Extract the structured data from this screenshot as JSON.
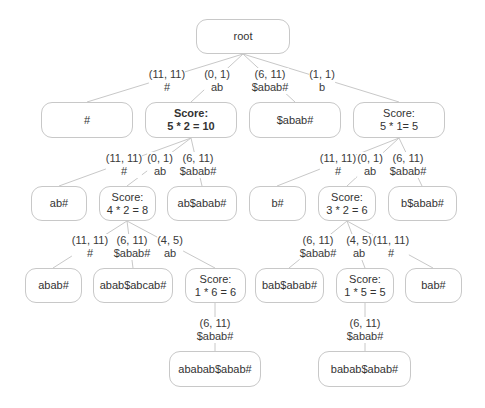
{
  "diagram": {
    "type": "suffix-tree-score",
    "nodes": [
      {
        "id": "root",
        "lines": [
          "root"
        ],
        "x": 196,
        "y": 19,
        "w": 94,
        "h": 35,
        "bold": false
      },
      {
        "id": "n_hash",
        "lines": [
          "#"
        ],
        "x": 41,
        "y": 102,
        "w": 92,
        "h": 36,
        "bold": false
      },
      {
        "id": "n_ab",
        "lines": [
          "Score:",
          "5 * 2 = 10"
        ],
        "x": 145,
        "y": 102,
        "w": 92,
        "h": 36,
        "bold": true
      },
      {
        "id": "n_sabab",
        "lines": [
          "$abab#"
        ],
        "x": 249,
        "y": 102,
        "w": 92,
        "h": 36,
        "bold": false
      },
      {
        "id": "n_b",
        "lines": [
          "Score:",
          "5 * 1= 5"
        ],
        "x": 353,
        "y": 102,
        "w": 92,
        "h": 36,
        "bold": false
      },
      {
        "id": "n_abhash",
        "lines": [
          "ab#"
        ],
        "x": 31,
        "y": 186,
        "w": 56,
        "h": 35,
        "bold": false
      },
      {
        "id": "n_abab",
        "lines": [
          "Score:",
          "4 * 2 = 8"
        ],
        "x": 99,
        "y": 186,
        "w": 57,
        "h": 35,
        "bold": false
      },
      {
        "id": "n_absabab",
        "lines": [
          "ab$abab#"
        ],
        "x": 167,
        "y": 186,
        "w": 70,
        "h": 35,
        "bold": false
      },
      {
        "id": "n_bhash",
        "lines": [
          "b#"
        ],
        "x": 249,
        "y": 186,
        "w": 57,
        "h": 35,
        "bold": false
      },
      {
        "id": "n_bab",
        "lines": [
          "Score:",
          "3 * 2 = 6"
        ],
        "x": 318,
        "y": 186,
        "w": 58,
        "h": 35,
        "bold": false
      },
      {
        "id": "n_bsabab",
        "lines": [
          "b$abab#"
        ],
        "x": 388,
        "y": 186,
        "w": 69,
        "h": 35,
        "bold": false
      },
      {
        "id": "n_ababhash",
        "lines": [
          "abab#"
        ],
        "x": 25,
        "y": 268,
        "w": 57,
        "h": 35,
        "bold": false
      },
      {
        "id": "n_ababsabcab",
        "lines": [
          "abab$abcab#"
        ],
        "x": 93,
        "y": 268,
        "w": 80,
        "h": 35,
        "bold": false
      },
      {
        "id": "n_ababab",
        "lines": [
          "Score:",
          "1 * 6 = 6"
        ],
        "x": 185,
        "y": 268,
        "w": 61,
        "h": 35,
        "bold": false
      },
      {
        "id": "n_babsabab",
        "lines": [
          "bab$abab#"
        ],
        "x": 255,
        "y": 268,
        "w": 69,
        "h": 35,
        "bold": false
      },
      {
        "id": "n_babab",
        "lines": [
          "Score:",
          "1 * 5 = 5"
        ],
        "x": 336,
        "y": 268,
        "w": 58,
        "h": 35,
        "bold": false
      },
      {
        "id": "n_babhash",
        "lines": [
          "bab#"
        ],
        "x": 405,
        "y": 268,
        "w": 57,
        "h": 35,
        "bold": false
      },
      {
        "id": "n_abababsabab",
        "lines": [
          "ababab$abab#"
        ],
        "x": 169,
        "y": 351,
        "w": 92,
        "h": 36,
        "bold": false
      },
      {
        "id": "n_bababsabab",
        "lines": [
          "babab$abab#"
        ],
        "x": 318,
        "y": 351,
        "w": 93,
        "h": 36,
        "bold": false
      }
    ],
    "edges": [
      {
        "from": "root",
        "to": "n_hash",
        "range": "(11, 11)",
        "substr": "#",
        "lx": 167,
        "ly": 68,
        "x1": 243,
        "y1": 54,
        "x2": 87,
        "y2": 102
      },
      {
        "from": "root",
        "to": "n_ab",
        "range": "(0, 1)",
        "substr": "ab",
        "lx": 217,
        "ly": 68,
        "x1": 243,
        "y1": 54,
        "x2": 191,
        "y2": 102
      },
      {
        "from": "root",
        "to": "n_sabab",
        "range": "(6, 11)",
        "substr": "$abab#",
        "lx": 270,
        "ly": 68,
        "x1": 243,
        "y1": 54,
        "x2": 295,
        "y2": 102
      },
      {
        "from": "root",
        "to": "n_b",
        "range": "(1, 1)",
        "substr": "b",
        "lx": 322,
        "ly": 68,
        "x1": 243,
        "y1": 54,
        "x2": 399,
        "y2": 102
      },
      {
        "from": "n_ab",
        "to": "n_abhash",
        "range": "(11, 11)",
        "substr": "#",
        "lx": 124,
        "ly": 152,
        "x1": 191,
        "y1": 138,
        "x2": 59,
        "y2": 186
      },
      {
        "from": "n_ab",
        "to": "n_abab",
        "range": "(0, 1)",
        "substr": "ab",
        "lx": 160,
        "ly": 152,
        "x1": 191,
        "y1": 138,
        "x2": 127,
        "y2": 186
      },
      {
        "from": "n_ab",
        "to": "n_absabab",
        "range": "(6, 11)",
        "substr": "$abab#",
        "lx": 198,
        "ly": 152,
        "x1": 191,
        "y1": 138,
        "x2": 202,
        "y2": 186
      },
      {
        "from": "n_b",
        "to": "n_bhash",
        "range": "(11, 11)",
        "substr": "#",
        "lx": 338,
        "ly": 152,
        "x1": 399,
        "y1": 138,
        "x2": 277,
        "y2": 186
      },
      {
        "from": "n_b",
        "to": "n_bab",
        "range": "(0, 1)",
        "substr": "ab",
        "lx": 370,
        "ly": 152,
        "x1": 399,
        "y1": 138,
        "x2": 347,
        "y2": 186
      },
      {
        "from": "n_b",
        "to": "n_bsabab",
        "range": "(6, 11)",
        "substr": "$abab#",
        "lx": 408,
        "ly": 152,
        "x1": 399,
        "y1": 138,
        "x2": 422,
        "y2": 186
      },
      {
        "from": "n_abab",
        "to": "n_ababhash",
        "range": "(11, 11)",
        "substr": "#",
        "lx": 90,
        "ly": 234,
        "x1": 127,
        "y1": 221,
        "x2": 53,
        "y2": 268
      },
      {
        "from": "n_abab",
        "to": "n_ababsabcab",
        "range": "(6, 11)",
        "substr": "$abab#",
        "lx": 132,
        "ly": 234,
        "x1": 127,
        "y1": 221,
        "x2": 133,
        "y2": 268
      },
      {
        "from": "n_abab",
        "to": "n_ababab",
        "range": "(4, 5)",
        "substr": "ab",
        "lx": 170,
        "ly": 234,
        "x1": 127,
        "y1": 221,
        "x2": 215,
        "y2": 268
      },
      {
        "from": "n_bab",
        "to": "n_babsabab",
        "range": "(6, 11)",
        "substr": "$abab#",
        "lx": 318,
        "ly": 234,
        "x1": 347,
        "y1": 221,
        "x2": 289,
        "y2": 268
      },
      {
        "from": "n_bab",
        "to": "n_babab",
        "range": "(4, 5)",
        "substr": "ab",
        "lx": 359,
        "ly": 234,
        "x1": 347,
        "y1": 221,
        "x2": 365,
        "y2": 268
      },
      {
        "from": "n_bab",
        "to": "n_babhash",
        "range": "(11, 11)",
        "substr": "#",
        "lx": 391,
        "ly": 234,
        "x1": 347,
        "y1": 221,
        "x2": 433,
        "y2": 268
      },
      {
        "from": "n_ababab",
        "to": "n_abababsabab",
        "range": "(6, 11)",
        "substr": "$abab#",
        "lx": 215,
        "ly": 317,
        "x1": 215,
        "y1": 303,
        "x2": 215,
        "y2": 351
      },
      {
        "from": "n_babab",
        "to": "n_bababsabab",
        "range": "(6, 11)",
        "substr": "$abab#",
        "lx": 365,
        "ly": 317,
        "x1": 365,
        "y1": 303,
        "x2": 365,
        "y2": 351
      }
    ],
    "colors": {
      "line": "#c8c8c8",
      "border": "#c8c8c8",
      "text": "#333333",
      "background": "#ffffff"
    }
  }
}
